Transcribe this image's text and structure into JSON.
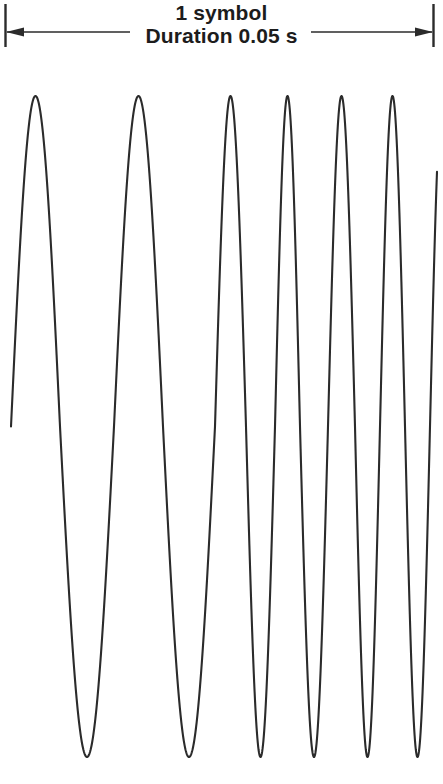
{
  "figure": {
    "type": "waveform-diagram",
    "background_color": "#ffffff",
    "stroke_color": "#2b2b2b",
    "caption": {
      "line1": "1 symbol",
      "line2": "Duration 0.05 s"
    },
    "span_marker": {
      "left_tick_x": 5,
      "right_tick_x": 433,
      "tick_top_y": 4,
      "tick_bottom_y": 46,
      "arrow_line_y": 32,
      "left_segment": [
        5,
        128
      ],
      "right_segment": [
        312,
        433
      ],
      "left_arrowhead": "arrow-left",
      "right_arrowhead": "arrow-right"
    }
  },
  "chart_data": {
    "type": "line",
    "title": "1 symbol",
    "subtitle": "Duration 0.05 s",
    "xlabel": "",
    "ylabel": "",
    "grid": false,
    "legend": null,
    "xlim": [
      0,
      0.05
    ],
    "ylim": [
      -1,
      1
    ],
    "x_units": "s",
    "amplitude": 1,
    "peak_pixel_y": 96,
    "trough_pixel_y": 757,
    "midline_pixel_y": 419,
    "start_point": {
      "x_px": 11,
      "y_px": 415
    },
    "end_point": {
      "x_px": 437,
      "y_px": 420
    },
    "peaks_px": [
      30,
      135,
      232,
      285,
      338,
      390
    ],
    "troughs_px": [
      91,
      196,
      264,
      317,
      371,
      425
    ],
    "zero_crossings_px": [
      11,
      60,
      114,
      163,
      215,
      246,
      275,
      300,
      328,
      355,
      380,
      405,
      430
    ],
    "cycle_count": 6,
    "segments": [
      {
        "x0_px": 11,
        "x1_px": 443,
        "period_start_px": 103,
        "period_end_px": 50
      }
    ]
  }
}
